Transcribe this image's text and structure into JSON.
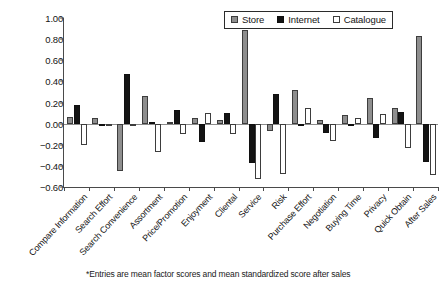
{
  "chart_data": {
    "type": "bar",
    "title": "",
    "xlabel": "",
    "ylabel": "",
    "ylim": [
      -0.6,
      1.0
    ],
    "ytick_step": 0.2,
    "ytick_labels": [
      "1.00",
      "0.80",
      "0.60",
      "0.40",
      "0.20",
      "0.00",
      "−0.20",
      "−0.40",
      "−0.60"
    ],
    "ytick_values": [
      1.0,
      0.8,
      0.6,
      0.4,
      0.2,
      0.0,
      -0.2,
      -0.4,
      -0.6
    ],
    "grid": false,
    "legend_position": "top-center",
    "categories": [
      "Compare Information",
      "Search Effort",
      "Search Convenience",
      "Assortment",
      "Price/Promotion",
      "Enjoyment",
      "Cliental",
      "Service",
      "Risk",
      "Purchase Effort",
      "Negotiation",
      "Buying Time",
      "Privacy",
      "Quick Obtain",
      "After Sales"
    ],
    "series": [
      {
        "name": "Store",
        "color": "#8e8e8e",
        "values": [
          0.06,
          0.05,
          -0.45,
          0.26,
          0.02,
          0.05,
          0.03,
          0.89,
          -0.07,
          0.32,
          0.03,
          0.08,
          0.24,
          0.15,
          0.83
        ]
      },
      {
        "name": "Internet",
        "color": "#141414",
        "values": [
          0.18,
          -0.02,
          0.47,
          0.02,
          0.13,
          -0.17,
          0.1,
          -0.37,
          0.28,
          -0.02,
          -0.09,
          0.0,
          -0.14,
          0.11,
          -0.36
        ]
      },
      {
        "name": "Catalogue",
        "color": "#ffffff",
        "values": [
          -0.2,
          -0.02,
          -0.01,
          -0.27,
          -0.1,
          0.1,
          -0.1,
          -0.52,
          -0.48,
          0.15,
          -0.16,
          0.05,
          0.09,
          -0.23,
          -0.49
        ]
      }
    ],
    "footnote": "*Entries are mean factor scores and mean standardized score after sales"
  },
  "legend": {
    "items": [
      {
        "label": "Store",
        "key": "store"
      },
      {
        "label": "Internet",
        "key": "internet"
      },
      {
        "label": "Catalogue",
        "key": "catalogue"
      }
    ]
  }
}
